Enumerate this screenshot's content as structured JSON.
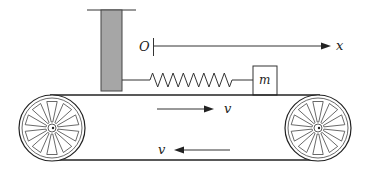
{
  "diagram": {
    "type": "physics-conveyor-spring-mass",
    "labels": {
      "origin": "O",
      "axis": "x",
      "mass": "m",
      "upper_velocity": "v",
      "lower_velocity": "v"
    },
    "colors": {
      "wall_fill": "#a6a6a6",
      "stroke": "#222222"
    },
    "spring_coils": 8,
    "wheel_spokes": 10
  }
}
